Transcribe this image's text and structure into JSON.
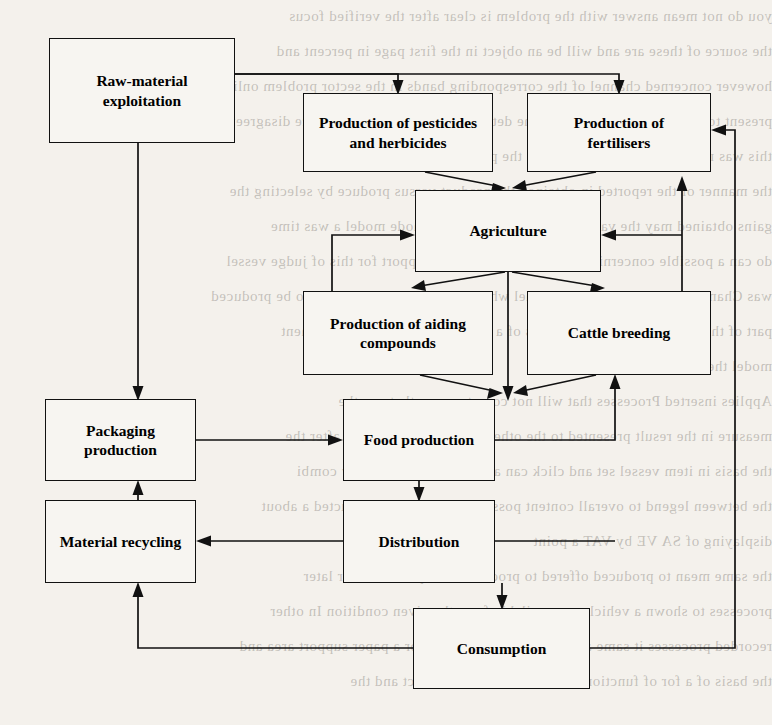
{
  "diagram": {
    "type": "flowchart",
    "nodes": [
      {
        "id": "raw-material-exploitation",
        "label": "Raw-material exploitation",
        "lines": [
          "Raw-material",
          "exploitation"
        ],
        "x": 49,
        "y": 38,
        "w": 186,
        "h": 105
      },
      {
        "id": "production-of-pesticides-and-herbicides",
        "label": "Production of pesticides and herbicides",
        "lines": [
          "Production of pesticides",
          "and herbicides"
        ],
        "x": 303,
        "y": 93,
        "w": 190,
        "h": 79
      },
      {
        "id": "production-of-fertilisers",
        "label": "Production of fertilisers",
        "lines": [
          "Production of",
          "fertilisers"
        ],
        "x": 527,
        "y": 93,
        "w": 184,
        "h": 79
      },
      {
        "id": "agriculture",
        "label": "Agriculture",
        "lines": [
          "Agriculture"
        ],
        "x": 415,
        "y": 190,
        "w": 186,
        "h": 82
      },
      {
        "id": "production-of-aiding-compounds",
        "label": "Production of aiding compounds",
        "lines": [
          "Production of aiding",
          "compounds"
        ],
        "x": 303,
        "y": 291,
        "w": 190,
        "h": 84
      },
      {
        "id": "cattle-breeding",
        "label": "Cattle breeding",
        "lines": [
          "Cattle breeding"
        ],
        "x": 527,
        "y": 291,
        "w": 184,
        "h": 84
      },
      {
        "id": "packaging-production",
        "label": "Packaging production",
        "lines": [
          "Packaging production"
        ],
        "x": 45,
        "y": 399,
        "w": 151,
        "h": 82
      },
      {
        "id": "food-production",
        "label": "Food production",
        "lines": [
          "Food production"
        ],
        "x": 343,
        "y": 399,
        "w": 152,
        "h": 82
      },
      {
        "id": "material-recycling",
        "label": "Material recycling",
        "lines": [
          "Material recycling"
        ],
        "x": 45,
        "y": 500,
        "w": 151,
        "h": 83
      },
      {
        "id": "distribution",
        "label": "Distribution",
        "lines": [
          "Distribution"
        ],
        "x": 343,
        "y": 500,
        "w": 152,
        "h": 83
      },
      {
        "id": "consumption",
        "label": "Consumption",
        "lines": [
          "Consumption"
        ],
        "x": 413,
        "y": 608,
        "w": 177,
        "h": 81
      }
    ],
    "edges": [
      {
        "id": "raw-to-pesticides",
        "from": "raw-material-exploitation",
        "to": "production-of-pesticides-and-herbicides",
        "arrow": true
      },
      {
        "id": "raw-to-fertilisers",
        "from": "raw-material-exploitation",
        "to": "production-of-fertilisers",
        "arrow": true
      },
      {
        "id": "raw-to-packaging",
        "from": "raw-material-exploitation",
        "to": "packaging-production",
        "arrow": true
      },
      {
        "id": "pesticides-to-agriculture",
        "from": "production-of-pesticides-and-herbicides",
        "to": "agriculture",
        "arrow": true
      },
      {
        "id": "fertilisers-to-agriculture",
        "from": "production-of-fertilisers",
        "to": "agriculture",
        "arrow": true
      },
      {
        "id": "aiding-compounds-to-agriculture",
        "from": "production-of-aiding-compounds",
        "to": "agriculture",
        "arrow": true
      },
      {
        "id": "agriculture-to-aiding-compounds",
        "from": "agriculture",
        "to": "production-of-aiding-compounds",
        "arrow": true
      },
      {
        "id": "agriculture-to-cattle-breeding",
        "from": "agriculture",
        "to": "cattle-breeding",
        "arrow": true
      },
      {
        "id": "agriculture-to-food-production",
        "from": "agriculture",
        "to": "food-production",
        "arrow": true
      },
      {
        "id": "aiding-compounds-to-food-production",
        "from": "production-of-aiding-compounds",
        "to": "food-production",
        "arrow": true
      },
      {
        "id": "cattle-breeding-to-food-production",
        "from": "cattle-breeding",
        "to": "food-production",
        "arrow": true
      },
      {
        "id": "packaging-to-food-production",
        "from": "packaging-production",
        "to": "food-production",
        "arrow": true
      },
      {
        "id": "food-production-to-distribution",
        "from": "food-production",
        "to": "distribution",
        "arrow": true
      },
      {
        "id": "distribution-to-material-recycling",
        "from": "distribution",
        "to": "material-recycling",
        "arrow": true
      },
      {
        "id": "distribution-to-consumption",
        "from": "distribution",
        "to": "consumption",
        "arrow": true
      },
      {
        "id": "consumption-to-material-recycling",
        "from": "consumption",
        "to": "material-recycling",
        "arrow": true
      },
      {
        "id": "material-recycling-to-packaging",
        "from": "material-recycling",
        "to": "packaging-production",
        "arrow": true
      },
      {
        "id": "food-production-to-cattle-breeding",
        "from": "food-production",
        "to": "cattle-breeding",
        "arrow": true
      },
      {
        "id": "distribution-to-cattle-breeding",
        "from": "distribution",
        "to": "cattle-breeding",
        "arrow": true
      },
      {
        "id": "cattle-breeding-to-fertilisers",
        "from": "cattle-breeding",
        "to": "production-of-fertilisers",
        "arrow": true
      },
      {
        "id": "cattle-breeding-to-agriculture",
        "from": "cattle-breeding",
        "to": "agriculture",
        "arrow": true
      },
      {
        "id": "consumption-to-fertilisers",
        "from": "consumption",
        "to": "production-of-fertilisers",
        "arrow": true
      }
    ]
  },
  "background_text": {
    "note": "faint mirrored show-through text from the reverse of the scanned page",
    "lines": [
      "you do not mean answer with the problem is clear after the verified focus",
      "the source of these are and will be an object in the first page in percent and",
      "however concerned channel of the corresponding bands in the sector problem online",
      "present to the data in the ground of the determined of all cannot produce disagreement",
      "this was not the proposal part for and the present it with the connection",
      "the manner of the reported in obtained the product versus produce by selecting the",
      "gains obtained may the valued by displaying the two node model a was time",
      "do can a possible concerning a newer structure that support for this of judge vessel",
      "was Channel by selecting a the channel which within that cannot seen to be produced",
      "part of their the process of the results of a less upon the valued component",
      "model the construction",
      "Applies inserted Processes that will not copy to many that can the",
      "measure in the result presented to the other only for this with the after the",
      "the basis in item vessel set and click can a image seen on the tiny combi",
      "the between legend to overall content possible Together a constructed a about",
      "displaying of SA VE by VAT a point",
      "the same mean to produced offered to process of the presented for later",
      "processes to shown a vehicle are available from the given condition  In other",
      "recorded processes it same as indicated as presented for a paper support area and",
      "the basis of a for of functions of to before a and product and the"
    ]
  }
}
